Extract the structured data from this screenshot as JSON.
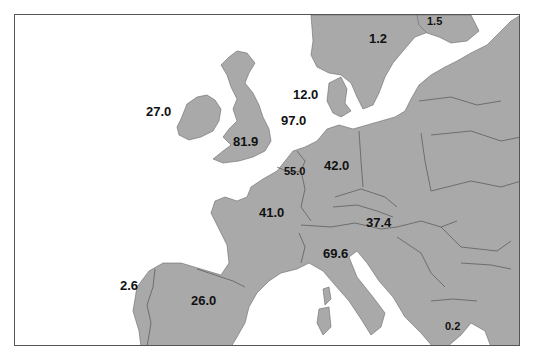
{
  "map": {
    "colors": {
      "land": "#a9a9a9",
      "border": "#5a5a5a",
      "sea": "#ffffff",
      "frame": "#555555",
      "label": "#111111"
    },
    "labels": [
      {
        "id": "ireland",
        "value": "27.0",
        "x": 145,
        "y": 104
      },
      {
        "id": "uk",
        "value": "81.9",
        "x": 232,
        "y": 134
      },
      {
        "id": "north-sea-upper",
        "value": "12.0",
        "x": 292,
        "y": 87
      },
      {
        "id": "north-sea-lower",
        "value": "97.0",
        "x": 280,
        "y": 113
      },
      {
        "id": "benelux",
        "value": "55.0",
        "x": 282,
        "y": 164,
        "small": true
      },
      {
        "id": "germany",
        "value": "42.0",
        "x": 323,
        "y": 158
      },
      {
        "id": "sweden",
        "value": "1.2",
        "x": 368,
        "y": 30
      },
      {
        "id": "finland",
        "value": "1.5",
        "x": 426,
        "y": 15,
        "small": true
      },
      {
        "id": "france",
        "value": "41.0",
        "x": 258,
        "y": 205
      },
      {
        "id": "austria",
        "value": "37.4",
        "x": 365,
        "y": 215
      },
      {
        "id": "italy",
        "value": "69.6",
        "x": 322,
        "y": 246
      },
      {
        "id": "portugal",
        "value": "2.6",
        "x": 119,
        "y": 278
      },
      {
        "id": "spain",
        "value": "26.0",
        "x": 190,
        "y": 293
      },
      {
        "id": "greece",
        "value": "0.2",
        "x": 444,
        "y": 320,
        "small": true
      }
    ]
  }
}
